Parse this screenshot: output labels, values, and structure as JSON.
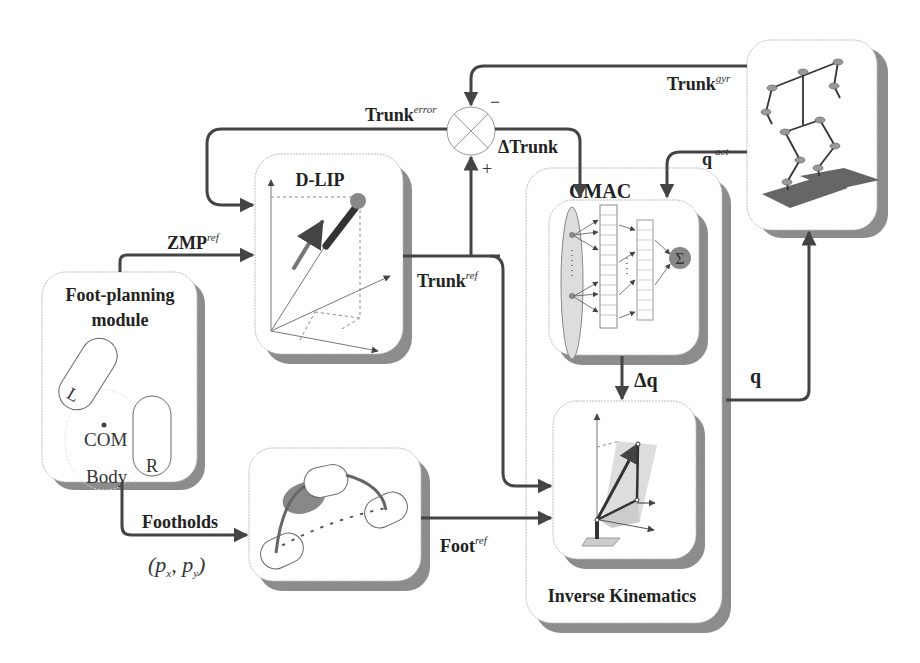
{
  "blocks": {
    "foot_planning": {
      "title_line1": "Foot-planning",
      "title_line2": "module",
      "left_foot": "L",
      "right_foot": "R",
      "com": "COM",
      "body": "Body"
    },
    "dlip": {
      "title": "D-LIP"
    },
    "foot_trajectory": {
      "title": "Foot Trajectory"
    },
    "cmac": {
      "title": "CMAC",
      "sum_symbol": "Σ"
    },
    "inverse_kinematics": {
      "title": "Inverse Kinematics"
    },
    "robot": {
      "title": ""
    }
  },
  "signals": {
    "zmp_ref": {
      "base": "ZMP",
      "sup": "ref"
    },
    "trunk_ref": {
      "base": "Trunk",
      "sup": "ref"
    },
    "trunk_error": {
      "base": "Trunk",
      "sup": "error"
    },
    "trunk_gyr": {
      "base": "Trunk",
      "sup": "gyr"
    },
    "delta_trunk": {
      "base": "ΔTrunk"
    },
    "q_act": {
      "base": "q",
      "sup": "act"
    },
    "delta_q": {
      "base": "Δq"
    },
    "q": {
      "base": "q"
    },
    "foot_ref": {
      "base": "Foot",
      "sup": "ref"
    },
    "footholds": {
      "base": "Footholds",
      "math": "(p",
      "sub_x": "x",
      "sep": ",  p",
      "sub_y": "y",
      "close": ")"
    }
  },
  "summing_junction": {
    "minus": "−",
    "plus": "+"
  },
  "colors": {
    "connector": "#444444",
    "shadow": "#8c8c8c",
    "accent_gray": "#777777"
  }
}
